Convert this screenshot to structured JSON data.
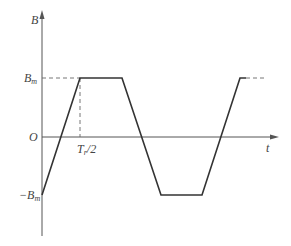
{
  "diagram": {
    "type": "trapezoidal waveform",
    "axes": {
      "y_label": "B",
      "x_label": "t",
      "origin_label": "O"
    },
    "levels": {
      "positive": {
        "base": "B",
        "sub": "m"
      },
      "negative": {
        "prefix": "−",
        "base": "B",
        "sub": "m"
      }
    },
    "markers": {
      "half_period": {
        "base": "T",
        "sub": "r",
        "suffix": "/2"
      }
    },
    "colors": {
      "axis": "#555555",
      "waveform": "#333333",
      "dashed": "#666666",
      "text": "#444444"
    }
  }
}
